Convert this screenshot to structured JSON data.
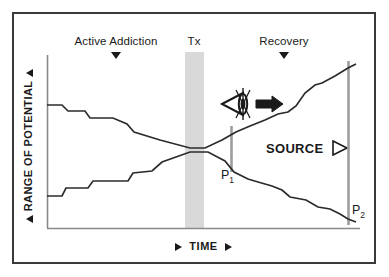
{
  "figure": {
    "axes": {
      "y_title": "RANGE OF POTENTIAL",
      "y_marker_top": "▲",
      "y_marker_bottom": "▲",
      "x_title": "TIME",
      "x_marker_left": "▶",
      "x_marker_right": "▶"
    },
    "phases": [
      {
        "id": "active-addiction",
        "label": "Active Addiction",
        "marker": "▼",
        "x": 116,
        "label_x": 116,
        "label_y": 36,
        "marker_y": 52
      },
      {
        "id": "tx",
        "label": "Tx",
        "marker": "▼",
        "x": 194,
        "label_x": 194,
        "label_y": 36,
        "marker_y": 52
      },
      {
        "id": "recovery",
        "label": "Recovery",
        "marker": "▼",
        "x": 284,
        "label_x": 284,
        "label_y": 36,
        "marker_y": 52
      }
    ],
    "treatment_band": {
      "label": "Tx",
      "color": "#d9d9d9",
      "x": 185,
      "width": 19,
      "y": 52,
      "height": 176
    },
    "annotations": {
      "source_label": "SOURCE",
      "source_arrow": "▷",
      "eye_icon": "eye-icon",
      "direction_arrow": "arrow-right-icon"
    },
    "points": [
      {
        "id": "p1",
        "label": "P",
        "subscript": "1",
        "x": 233,
        "y": 177
      },
      {
        "id": "p2",
        "label": "P",
        "subscript": "2",
        "x": 350,
        "y": 211
      }
    ],
    "markers": [
      {
        "id": "p1-bar",
        "x": 231,
        "y_top": 126,
        "y_bottom": 172,
        "color": "#9d9d9d"
      },
      {
        "id": "p2-bar",
        "x": 348,
        "y_top": 61,
        "y_bottom": 225,
        "color": "#9d9d9d"
      }
    ],
    "colors": {
      "frame": "#3a3a3c",
      "axis": "#7a7a7a",
      "curve": "#2b2b2b",
      "band": "#d9d9d9",
      "bar": "#9d9d9d",
      "text": "#1a1a1a",
      "background": "#ffffff"
    }
  },
  "chart_data": {
    "type": "line",
    "title": "",
    "xlabel": "TIME",
    "ylabel": "RANGE OF POTENTIAL",
    "grid": false,
    "legend": false,
    "axis_origin": {
      "x": 47,
      "y": 228
    },
    "axis_extent": {
      "x": 360,
      "y": 55
    },
    "series": [
      {
        "name": "upper-trajectory",
        "note": "Descending during Active Addiction, converges at Tx, then ascends through Recovery",
        "points": [
          [
            47,
            105
          ],
          [
            62,
            105
          ],
          [
            68,
            111
          ],
          [
            85,
            111
          ],
          [
            90,
            118
          ],
          [
            113,
            118
          ],
          [
            127,
            124
          ],
          [
            134,
            132
          ],
          [
            160,
            140
          ],
          [
            190,
            148
          ],
          [
            205,
            148
          ],
          [
            222,
            140
          ],
          [
            236,
            132
          ],
          [
            250,
            126
          ],
          [
            265,
            120
          ],
          [
            278,
            114
          ],
          [
            288,
            112
          ],
          [
            296,
            106
          ],
          [
            305,
            93
          ],
          [
            315,
            85
          ],
          [
            322,
            83
          ],
          [
            335,
            76
          ],
          [
            348,
            68
          ],
          [
            356,
            64
          ]
        ]
      },
      {
        "name": "lower-trajectory",
        "note": "Ascending during Active Addiction, converges at Tx, then descends through Recovery",
        "points": [
          [
            47,
            196
          ],
          [
            62,
            196
          ],
          [
            66,
            188
          ],
          [
            88,
            188
          ],
          [
            93,
            181
          ],
          [
            112,
            181
          ],
          [
            117,
            181
          ],
          [
            128,
            181
          ],
          [
            133,
            173
          ],
          [
            152,
            171
          ],
          [
            162,
            162
          ],
          [
            190,
            152
          ],
          [
            208,
            152
          ],
          [
            225,
            161
          ],
          [
            234,
            172
          ],
          [
            248,
            179
          ],
          [
            258,
            182
          ],
          [
            272,
            186
          ],
          [
            282,
            190
          ],
          [
            290,
            197
          ],
          [
            306,
            200
          ],
          [
            318,
            207
          ],
          [
            330,
            209
          ],
          [
            340,
            214
          ],
          [
            348,
            219
          ],
          [
            356,
            222
          ]
        ]
      }
    ]
  }
}
